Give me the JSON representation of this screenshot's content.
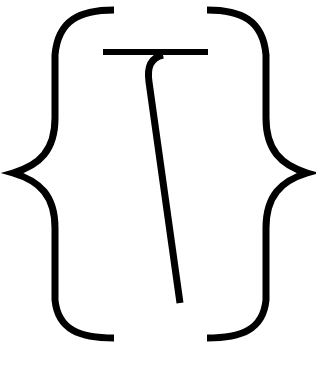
{
  "logo": {
    "description": "Curly braces enclosing a stylized T glyph",
    "stroke_color": "#000000",
    "background_color": "#ffffff"
  }
}
